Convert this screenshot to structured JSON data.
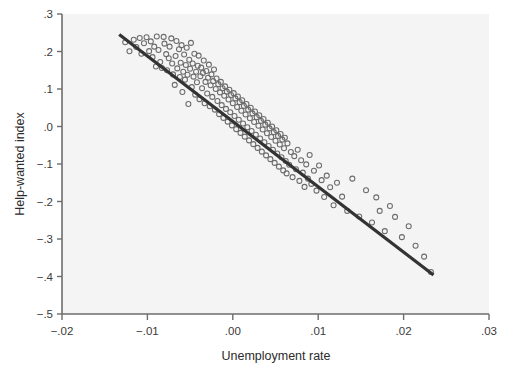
{
  "chart_data": {
    "type": "scatter",
    "title": "",
    "xlabel": "Unemployment rate",
    "ylabel": "Help-wanted index",
    "xlim": [
      -0.02,
      0.03
    ],
    "ylim": [
      -0.5,
      0.3
    ],
    "xticks": [
      -0.02,
      -0.01,
      0.0,
      0.01,
      0.02,
      0.03
    ],
    "xticklabels": [
      "−.02",
      "−.01",
      ".00",
      ".01",
      ".02",
      ".03"
    ],
    "yticks": [
      0.3,
      0.2,
      0.1,
      0.0,
      -0.1,
      -0.2,
      -0.3,
      -0.4,
      -0.5
    ],
    "yticklabels": [
      ".3",
      ".2",
      ".1",
      ".0",
      "−.1",
      "−.2",
      "−.3",
      "−.4",
      "−.5"
    ],
    "grid": false,
    "legend": null,
    "marker": "open-circle",
    "marker_color": "#6b6b6b",
    "plot_background": "#f4f4f4",
    "fit_line": {
      "type": "linear-regression",
      "color": "#333333",
      "x_start": -0.0133,
      "y_start": 0.2455,
      "x_end": 0.0235,
      "y_end": -0.396,
      "slope": -17.43,
      "intercept": 0.0135
    },
    "points": [
      [
        -0.0126,
        0.2248
      ],
      [
        -0.0121,
        0.2007
      ],
      [
        -0.0116,
        0.2314
      ],
      [
        -0.0113,
        0.212
      ],
      [
        -0.0109,
        0.236
      ],
      [
        -0.0107,
        0.194
      ],
      [
        -0.0104,
        0.2218
      ],
      [
        -0.0101,
        0.238
      ],
      [
        -0.0098,
        0.201
      ],
      [
        -0.0096,
        0.227
      ],
      [
        -0.0094,
        0.185
      ],
      [
        -0.0092,
        0.213
      ],
      [
        -0.009,
        0.16
      ],
      [
        -0.0089,
        0.24
      ],
      [
        -0.0087,
        0.204
      ],
      [
        -0.0085,
        0.172
      ],
      [
        -0.0083,
        0.156
      ],
      [
        -0.0081,
        0.239
      ],
      [
        -0.008,
        0.221
      ],
      [
        -0.0078,
        0.193
      ],
      [
        -0.0077,
        0.15
      ],
      [
        -0.0075,
        0.182
      ],
      [
        -0.0074,
        0.213
      ],
      [
        -0.0072,
        0.235
      ],
      [
        -0.0071,
        0.168
      ],
      [
        -0.007,
        0.139
      ],
      [
        -0.0068,
        0.111
      ],
      [
        -0.0067,
        0.188
      ],
      [
        -0.0066,
        0.228
      ],
      [
        -0.0065,
        0.155
      ],
      [
        -0.0063,
        0.206
      ],
      [
        -0.0062,
        0.132
      ],
      [
        -0.0061,
        0.17
      ],
      [
        -0.006,
        0.217
      ],
      [
        -0.0059,
        0.092
      ],
      [
        -0.0058,
        0.146
      ],
      [
        -0.0057,
        0.192
      ],
      [
        -0.0056,
        0.125
      ],
      [
        -0.0055,
        0.164
      ],
      [
        -0.0054,
        0.21
      ],
      [
        -0.0053,
        0.138
      ],
      [
        -0.0052,
        0.06
      ],
      [
        -0.0051,
        0.178
      ],
      [
        -0.005,
        0.154
      ],
      [
        -0.0049,
        0.223
      ],
      [
        -0.0048,
        0.105
      ],
      [
        -0.0047,
        0.168
      ],
      [
        -0.0046,
        0.133
      ],
      [
        -0.0045,
        0.194
      ],
      [
        -0.0044,
        0.085
      ],
      [
        -0.0043,
        0.146
      ],
      [
        -0.0042,
        0.118
      ],
      [
        -0.0041,
        0.162
      ],
      [
        -0.004,
        0.189
      ],
      [
        -0.0039,
        0.073
      ],
      [
        -0.0038,
        0.134
      ],
      [
        -0.0037,
        0.157
      ],
      [
        -0.0036,
        0.102
      ],
      [
        -0.0035,
        0.143
      ],
      [
        -0.0034,
        0.176
      ],
      [
        -0.0033,
        0.062
      ],
      [
        -0.0032,
        0.119
      ],
      [
        -0.0031,
        0.148
      ],
      [
        -0.003,
        0.088
      ],
      [
        -0.0029,
        0.13
      ],
      [
        -0.0028,
        0.165
      ],
      [
        -0.0027,
        0.054
      ],
      [
        -0.0026,
        0.11
      ],
      [
        -0.0025,
        0.139
      ],
      [
        -0.0024,
        0.079
      ],
      [
        -0.0023,
        0.121
      ],
      [
        -0.0022,
        0.152
      ],
      [
        -0.0021,
        0.045
      ],
      [
        -0.002,
        0.1
      ],
      [
        -0.0019,
        0.128
      ],
      [
        -0.0018,
        0.068
      ],
      [
        -0.0017,
        0.113
      ],
      [
        -0.0016,
        0.033
      ],
      [
        -0.0015,
        0.091
      ],
      [
        -0.0014,
        0.119
      ],
      [
        -0.0013,
        0.057
      ],
      [
        -0.0012,
        0.102
      ],
      [
        -0.0011,
        0.023
      ],
      [
        -0.001,
        0.082
      ],
      [
        -0.0009,
        0.107
      ],
      [
        -0.0008,
        0.047
      ],
      [
        -0.0007,
        0.093
      ],
      [
        -0.0006,
        0.013
      ],
      [
        -0.0005,
        0.072
      ],
      [
        -0.0004,
        0.098
      ],
      [
        -0.0003,
        0.038
      ],
      [
        -0.0002,
        0.084
      ],
      [
        -0.0001,
        0.003
      ],
      [
        0.0,
        0.062
      ],
      [
        0.0001,
        0.089
      ],
      [
        0.0002,
        0.028
      ],
      [
        0.0003,
        0.075
      ],
      [
        0.0004,
        -0.007
      ],
      [
        0.0005,
        0.052
      ],
      [
        0.0006,
        0.08
      ],
      [
        0.0007,
        0.018
      ],
      [
        0.0008,
        0.065
      ],
      [
        0.0009,
        -0.017
      ],
      [
        0.001,
        0.042
      ],
      [
        0.0011,
        0.07
      ],
      [
        0.0012,
        0.008
      ],
      [
        0.0013,
        0.055
      ],
      [
        0.0014,
        -0.027
      ],
      [
        0.0015,
        0.032
      ],
      [
        0.0016,
        0.06
      ],
      [
        0.0017,
        -0.002
      ],
      [
        0.0018,
        0.045
      ],
      [
        0.0019,
        -0.037
      ],
      [
        0.002,
        0.022
      ],
      [
        0.0021,
        0.05
      ],
      [
        0.0022,
        -0.012
      ],
      [
        0.0023,
        0.035
      ],
      [
        0.0024,
        -0.047
      ],
      [
        0.0025,
        0.012
      ],
      [
        0.0026,
        0.04
      ],
      [
        0.0027,
        -0.022
      ],
      [
        0.0028,
        0.025
      ],
      [
        0.0029,
        -0.057
      ],
      [
        0.003,
        0.002
      ],
      [
        0.0031,
        0.03
      ],
      [
        0.0032,
        -0.032
      ],
      [
        0.0033,
        0.015
      ],
      [
        0.0034,
        -0.067
      ],
      [
        0.0035,
        -0.008
      ],
      [
        0.0036,
        0.02
      ],
      [
        0.0037,
        -0.042
      ],
      [
        0.0038,
        0.005
      ],
      [
        0.0039,
        -0.077
      ],
      [
        0.004,
        -0.018
      ],
      [
        0.0041,
        0.01
      ],
      [
        0.0042,
        -0.052
      ],
      [
        0.0043,
        -0.005
      ],
      [
        0.0044,
        -0.087
      ],
      [
        0.0045,
        -0.028
      ],
      [
        0.0046,
        0.0
      ],
      [
        0.0047,
        -0.062
      ],
      [
        0.0048,
        -0.015
      ],
      [
        0.0049,
        -0.097
      ],
      [
        0.005,
        -0.038
      ],
      [
        0.0051,
        -0.01
      ],
      [
        0.0052,
        -0.072
      ],
      [
        0.0053,
        -0.025
      ],
      [
        0.0054,
        -0.107
      ],
      [
        0.0055,
        -0.048
      ],
      [
        0.0056,
        -0.02
      ],
      [
        0.0057,
        -0.082
      ],
      [
        0.0058,
        -0.035
      ],
      [
        0.0059,
        -0.117
      ],
      [
        0.006,
        -0.058
      ],
      [
        0.0061,
        -0.03
      ],
      [
        0.0062,
        -0.092
      ],
      [
        0.0063,
        -0.125
      ],
      [
        0.0064,
        -0.045
      ],
      [
        0.0066,
        -0.102
      ],
      [
        0.0068,
        -0.068
      ],
      [
        0.007,
        -0.135
      ],
      [
        0.0072,
        -0.079
      ],
      [
        0.0074,
        -0.114
      ],
      [
        0.0076,
        -0.062
      ],
      [
        0.0078,
        -0.145
      ],
      [
        0.008,
        -0.09
      ],
      [
        0.0082,
        -0.123
      ],
      [
        0.0084,
        -0.161
      ],
      [
        0.0086,
        -0.101
      ],
      [
        0.0088,
        -0.139
      ],
      [
        0.009,
        -0.076
      ],
      [
        0.0092,
        -0.153
      ],
      [
        0.0095,
        -0.118
      ],
      [
        0.0098,
        -0.171
      ],
      [
        0.0101,
        -0.104
      ],
      [
        0.0104,
        -0.143
      ],
      [
        0.0107,
        -0.188
      ],
      [
        0.011,
        -0.131
      ],
      [
        0.0114,
        -0.162
      ],
      [
        0.0118,
        -0.21
      ],
      [
        0.0122,
        -0.15
      ],
      [
        0.0128,
        -0.187
      ],
      [
        0.0134,
        -0.225
      ],
      [
        0.014,
        -0.139
      ],
      [
        0.0148,
        -0.24
      ],
      [
        0.0156,
        -0.17
      ],
      [
        0.0163,
        -0.256
      ],
      [
        0.0168,
        -0.189
      ],
      [
        0.0172,
        -0.225
      ],
      [
        0.0178,
        -0.279
      ],
      [
        0.0184,
        -0.212
      ],
      [
        0.019,
        -0.241
      ],
      [
        0.0198,
        -0.295
      ],
      [
        0.0206,
        -0.266
      ],
      [
        0.0214,
        -0.318
      ],
      [
        0.0224,
        -0.347
      ],
      [
        0.0232,
        -0.388
      ]
    ]
  },
  "figure": {
    "background": "#ffffff",
    "plot_area": {
      "left": 62,
      "top": 14,
      "right": 489,
      "bottom": 314
    }
  }
}
